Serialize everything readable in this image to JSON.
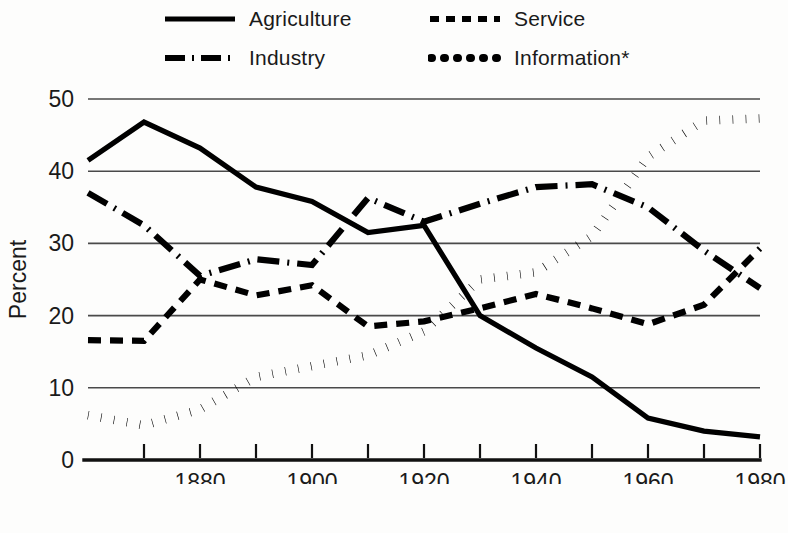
{
  "legend": {
    "items": [
      {
        "label": "Agriculture",
        "style": "solid",
        "swatch_name": "legend-swatch-solid"
      },
      {
        "label": "Service",
        "style": "dashed",
        "swatch_name": "legend-swatch-dashed"
      },
      {
        "label": "Industry",
        "style": "dashdot",
        "swatch_name": "legend-swatch-dashdot"
      },
      {
        "label": "Information*",
        "style": "dotted",
        "swatch_name": "legend-swatch-dotted"
      }
    ]
  },
  "axes": {
    "ylabel": "Percent",
    "xlabel": "Year",
    "ytick_labels": [
      "50",
      "40",
      "30",
      "20",
      "10",
      "0"
    ],
    "xtick_labels": [
      "1880",
      "1900",
      "1920",
      "1940",
      "1960",
      "1980"
    ]
  },
  "chart_data": {
    "type": "line",
    "title": "",
    "subtitle": "",
    "xlabel": "Year",
    "ylabel": "Percent",
    "xlim": [
      1860,
      1980
    ],
    "ylim": [
      0,
      50
    ],
    "yticks": [
      0,
      10,
      20,
      30,
      40,
      50
    ],
    "xticks": [
      1880,
      1900,
      1920,
      1940,
      1960,
      1980
    ],
    "xtick_labels": [
      "1880",
      "1900",
      "1920",
      "1940",
      "1960",
      "1980"
    ],
    "ytick_labels": [
      "0",
      "10",
      "20",
      "30",
      "40",
      "50"
    ],
    "grid": "horizontal",
    "legend_position": "above-plot",
    "line_color": "#000000",
    "annotations": [
      "Information*"
    ],
    "series": [
      {
        "name": "Agriculture",
        "style": "solid",
        "x": [
          1860,
          1870,
          1880,
          1890,
          1900,
          1910,
          1920,
          1930,
          1940,
          1950,
          1960,
          1970,
          1980
        ],
        "values": [
          41.5,
          46.8,
          43.2,
          37.8,
          35.8,
          31.5,
          32.5,
          20.0,
          15.5,
          11.5,
          5.8,
          4.0,
          3.2
        ]
      },
      {
        "name": "Service",
        "style": "dashed",
        "x": [
          1860,
          1870,
          1880,
          1890,
          1900,
          1910,
          1920,
          1930,
          1940,
          1950,
          1960,
          1970,
          1980
        ],
        "values": [
          16.6,
          16.5,
          25.0,
          22.8,
          24.2,
          18.5,
          19.2,
          21.0,
          23.0,
          21.0,
          18.8,
          21.5,
          29.3
        ]
      },
      {
        "name": "Industry",
        "style": "dashdot",
        "x": [
          1860,
          1870,
          1880,
          1890,
          1900,
          1910,
          1920,
          1930,
          1940,
          1950,
          1960,
          1970,
          1980
        ],
        "values": [
          37.0,
          32.5,
          25.5,
          27.8,
          27.0,
          36.3,
          33.0,
          35.5,
          37.8,
          38.2,
          35.0,
          29.0,
          23.8
        ]
      },
      {
        "name": "Information*",
        "style": "dotted",
        "x": [
          1860,
          1870,
          1880,
          1890,
          1900,
          1910,
          1920,
          1930,
          1940,
          1950,
          1960,
          1970,
          1980
        ],
        "values": [
          6.2,
          4.8,
          7.0,
          11.5,
          13.0,
          14.5,
          17.8,
          25.0,
          26.0,
          31.0,
          42.0,
          47.0,
          47.3
        ]
      }
    ]
  }
}
